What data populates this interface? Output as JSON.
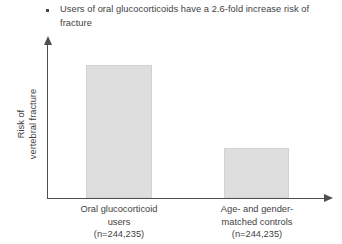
{
  "bullet": {
    "marker": "square-bullet",
    "text": "Users of oral glucocorticoids have a 2.6-fold increase risk of fracture"
  },
  "chart_data": {
    "type": "bar",
    "title": "",
    "xlabel": "",
    "ylabel": "Risk of vertebral fracture",
    "ylabel_lines": [
      "Risk of",
      "vertebral fracture"
    ],
    "categories": [
      "Oral glucocorticoid users (n=244,235)",
      "Age- and gender-matched controls (n=244,235)"
    ],
    "category_lines": [
      [
        "Oral glucocorticoid",
        "users",
        "(n=244,235)"
      ],
      [
        "Age- and gender-",
        "matched controls",
        "(n=244,235)"
      ]
    ],
    "values": [
      2.6,
      1.0
    ],
    "value_unit": "relative risk",
    "ylim": [
      0,
      3.0
    ],
    "grid": false,
    "legend": "none",
    "bar_color": "#dedede",
    "bar_border_color": "#d2d2d2",
    "axis_color": "#4f4f4f",
    "text_color": "#3f3f3f",
    "annotations": [
      "2.6-fold increased risk of fracture in oral glucocorticoid users"
    ],
    "sample_sizes": [
      "n=244,235",
      "n=244,235"
    ]
  }
}
